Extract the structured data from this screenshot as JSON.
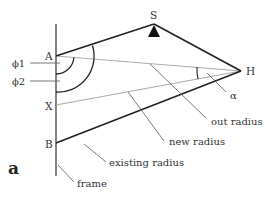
{
  "diagram": {
    "panel_label": "a",
    "points": {
      "S": "S",
      "H": "H",
      "A": "A",
      "X": "X",
      "B": "B"
    },
    "angles": {
      "phi1": "ϕ1",
      "phi2": "ϕ2",
      "alpha": "α"
    },
    "callouts": {
      "out_radius": "out radius",
      "new_radius": "new radius",
      "existing_radius": "existing radius",
      "frame": "frame"
    },
    "colors": {
      "dark_line": "#222222",
      "light_line": "#aaaaaa",
      "frame_line": "#666666",
      "leader_line": "#555555",
      "text": "#333333"
    }
  }
}
